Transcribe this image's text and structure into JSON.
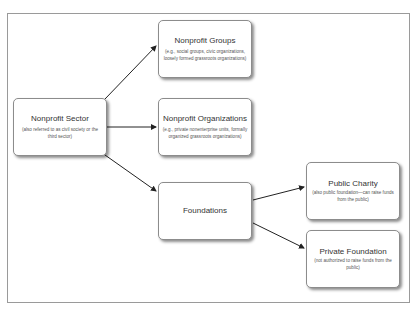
{
  "diagram": {
    "nodes": [
      {
        "id": "sector",
        "title": "Nonprofit Sector",
        "subtitle": "(also referred to as civil society or the third sector)"
      },
      {
        "id": "groups",
        "title": "Nonprofit Groups",
        "subtitle": "(e.g., social groups, civic organizations, loosely formed grassroots organizations)"
      },
      {
        "id": "orgs",
        "title": "Nonprofit Organizations",
        "subtitle": "(e.g., private nonenterprise units, formally organized grassroots organizations)"
      },
      {
        "id": "foundations",
        "title": "Foundations",
        "subtitle": ""
      },
      {
        "id": "charity",
        "title": "Public Charity",
        "subtitle": "(also public foundation—can raise funds from the public)"
      },
      {
        "id": "private",
        "title": "Private Foundation",
        "subtitle": "(not authorized to raise funds from the public)"
      }
    ],
    "edges": [
      {
        "from": "sector",
        "to": "groups"
      },
      {
        "from": "sector",
        "to": "orgs"
      },
      {
        "from": "sector",
        "to": "foundations"
      },
      {
        "from": "foundations",
        "to": "charity"
      },
      {
        "from": "foundations",
        "to": "private"
      }
    ]
  }
}
